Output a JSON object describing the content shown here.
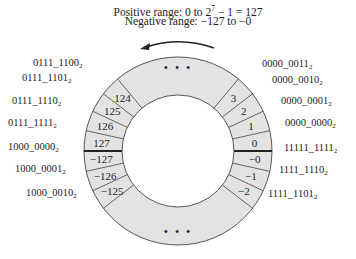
{
  "caption": {
    "line1_prefix": "Positive range: 0 to 2",
    "line1_exp": "7",
    "line1_suffix": " − 1 = 127",
    "line2": "Negative range: −127 to −0"
  },
  "ring": {
    "center": [
      178,
      151
    ],
    "outer_radius": 94,
    "inner_radius": 56,
    "fill": "#e3e3e3",
    "stroke": "#444444",
    "ellipsis": "• • •",
    "segment_angle_deg": 12.5
  },
  "segments": [
    {
      "value": "0",
      "start": 0,
      "binary": "0000_0000",
      "side": "right"
    },
    {
      "value": "1",
      "start": 12.5,
      "binary": "0000_0001",
      "side": "right"
    },
    {
      "value": "2",
      "start": 25,
      "binary": "0000_0010",
      "side": "right"
    },
    {
      "value": "3",
      "start": 37.5,
      "binary": "0000_0011",
      "side": "right"
    },
    {
      "value": "−0",
      "start": -12.5,
      "binary": "11111_1111",
      "side": "right"
    },
    {
      "value": "−1",
      "start": -25,
      "binary": "1111_1110",
      "side": "right"
    },
    {
      "value": "−2",
      "start": -37.5,
      "binary": "1111_1101",
      "side": "right"
    },
    {
      "value": "127",
      "start": 167.5,
      "binary": "0111_1111",
      "side": "left"
    },
    {
      "value": "126",
      "start": 155,
      "binary": "0111_1110",
      "side": "left"
    },
    {
      "value": "125",
      "start": 142.5,
      "binary": "0111_1101",
      "side": "left"
    },
    {
      "value": "124",
      "start": 130,
      "binary": "0111_1100",
      "side": "left"
    },
    {
      "value": "−127",
      "start": 180,
      "binary": "1000_0000",
      "side": "left"
    },
    {
      "value": "−126",
      "start": 192.5,
      "binary": "1000_0001",
      "side": "left"
    },
    {
      "value": "−125",
      "start": 205,
      "binary": "1000_0010",
      "side": "left"
    }
  ],
  "labels": [
    {
      "text": "0111_1100",
      "sub": "2",
      "x": 33,
      "y": 66
    },
    {
      "text": "0111_1101",
      "sub": "2",
      "x": 22,
      "y": 81
    },
    {
      "text": "0111_1110",
      "sub": "2",
      "x": 12,
      "y": 104
    },
    {
      "text": "0111_1111",
      "sub": "2",
      "x": 8,
      "y": 126
    },
    {
      "text": "1000_0000",
      "sub": "2",
      "x": 8,
      "y": 150
    },
    {
      "text": "1000_0001",
      "sub": "2",
      "x": 15,
      "y": 172
    },
    {
      "text": "1000_0010",
      "sub": "2",
      "x": 26,
      "y": 196
    },
    {
      "text": "0000_0011",
      "sub": "2",
      "x": 262,
      "y": 67
    },
    {
      "text": "0000_0010",
      "sub": "2",
      "x": 272,
      "y": 83
    },
    {
      "text": "0000_0001",
      "sub": "2",
      "x": 281,
      "y": 104
    },
    {
      "text": "0000_0000",
      "sub": "2",
      "x": 285,
      "y": 126
    },
    {
      "text": "11111_1111",
      "sub": "2",
      "x": 284,
      "y": 151
    },
    {
      "text": "1111_1110",
      "sub": "2",
      "x": 279,
      "y": 173
    },
    {
      "text": "1111_1101",
      "sub": "2",
      "x": 268,
      "y": 197
    }
  ],
  "zero_boundary": "thick divider between +0/−0 and 127/−127"
}
